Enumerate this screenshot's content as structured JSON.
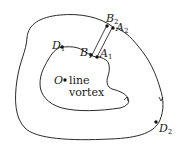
{
  "diagram": {
    "type": "line-vortex-circuits",
    "colors": {
      "stroke": "#2a2a2a",
      "text": "#1a1a1a",
      "background": "#ffffff"
    },
    "points": [
      {
        "id": "O",
        "label": "O",
        "sub": ""
      },
      {
        "id": "D1",
        "label": "D",
        "sub": "1"
      },
      {
        "id": "B1",
        "label": "B",
        "sub": "1"
      },
      {
        "id": "A1",
        "label": "A",
        "sub": "1"
      },
      {
        "id": "B2",
        "label": "B",
        "sub": "2"
      },
      {
        "id": "A2",
        "label": "A",
        "sub": "2"
      },
      {
        "id": "D2",
        "label": "D",
        "sub": "2"
      }
    ],
    "vortex_label_line1": "line",
    "vortex_label_line2": "vortex",
    "curves": [
      {
        "name": "outer-circuit",
        "direction": "clockwise"
      },
      {
        "name": "inner-circuit",
        "direction": "clockwise"
      },
      {
        "name": "connector-B1-B2"
      },
      {
        "name": "connector-A1-A2"
      }
    ]
  }
}
